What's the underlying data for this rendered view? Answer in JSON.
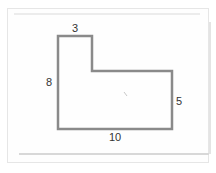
{
  "diagram": {
    "type": "L-shaped polygon",
    "labels": {
      "top": "3",
      "left": "8",
      "right": "5",
      "bottom": "10"
    },
    "stroke_color": "#8a8a8a"
  }
}
